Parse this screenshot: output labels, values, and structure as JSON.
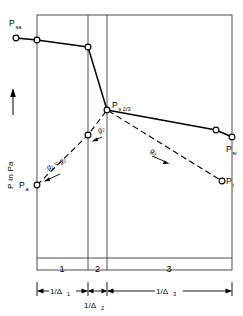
{
  "figure": {
    "axis": {
      "y_label": "P  in  Pa",
      "y_arrow": "up-arrow"
    },
    "zones": [
      {
        "id": "zone-1",
        "label": "1"
      },
      {
        "id": "zone-2",
        "label": "2"
      },
      {
        "id": "zone-3",
        "label": "3"
      }
    ],
    "dimensions": [
      {
        "id": "dim-1",
        "label": "1/Δ",
        "sub": "1"
      },
      {
        "id": "dim-2",
        "label": "1/Δ",
        "sub": "2"
      },
      {
        "id": "dim-3",
        "label": "1/Δ",
        "sub": "3"
      }
    ],
    "points": [
      {
        "id": "p-sa",
        "label": "P",
        "sub": "sa",
        "x": 16,
        "y": 32
      },
      {
        "id": "p-a",
        "label": "P",
        "sub": "a",
        "x": 37,
        "y": 185
      },
      {
        "id": "p-s23",
        "label": "P",
        "sub": "s 2/3",
        "x": 107,
        "y": 110
      },
      {
        "id": "p-si",
        "label": "P",
        "sub": "si",
        "x": 232,
        "y": 137
      },
      {
        "id": "p-i",
        "label": "P",
        "sub": "i",
        "x": 222,
        "y": 181
      }
    ],
    "gradients": [
      {
        "id": "g-12",
        "label": "g",
        "sub": "1",
        "eq": " ≈ ",
        "label2": "g",
        "sub2": "2",
        "text": "g₁ ≈ g₂"
      },
      {
        "id": "g-2",
        "label": "g",
        "sub": "2",
        "text": "g₂"
      },
      {
        "id": "g-3",
        "label": "g",
        "sub": "3",
        "text": "g₃"
      }
    ],
    "colors": {
      "line": "#000000",
      "frame": "#3a3a3a",
      "background": "#ffffff",
      "marker_fill": "#ffffff"
    },
    "series": {
      "solid_profile": [
        {
          "x": 16,
          "y": 38
        },
        {
          "x": 37,
          "y": 40
        },
        {
          "x": 88,
          "y": 47
        },
        {
          "x": 107,
          "y": 110
        },
        {
          "x": 216,
          "y": 130
        },
        {
          "x": 232,
          "y": 137
        }
      ],
      "dashed_profile": [
        {
          "x": 37,
          "y": 185
        },
        {
          "x": 88,
          "y": 135
        },
        {
          "x": 107,
          "y": 110
        },
        {
          "x": 222,
          "y": 181
        }
      ]
    }
  }
}
